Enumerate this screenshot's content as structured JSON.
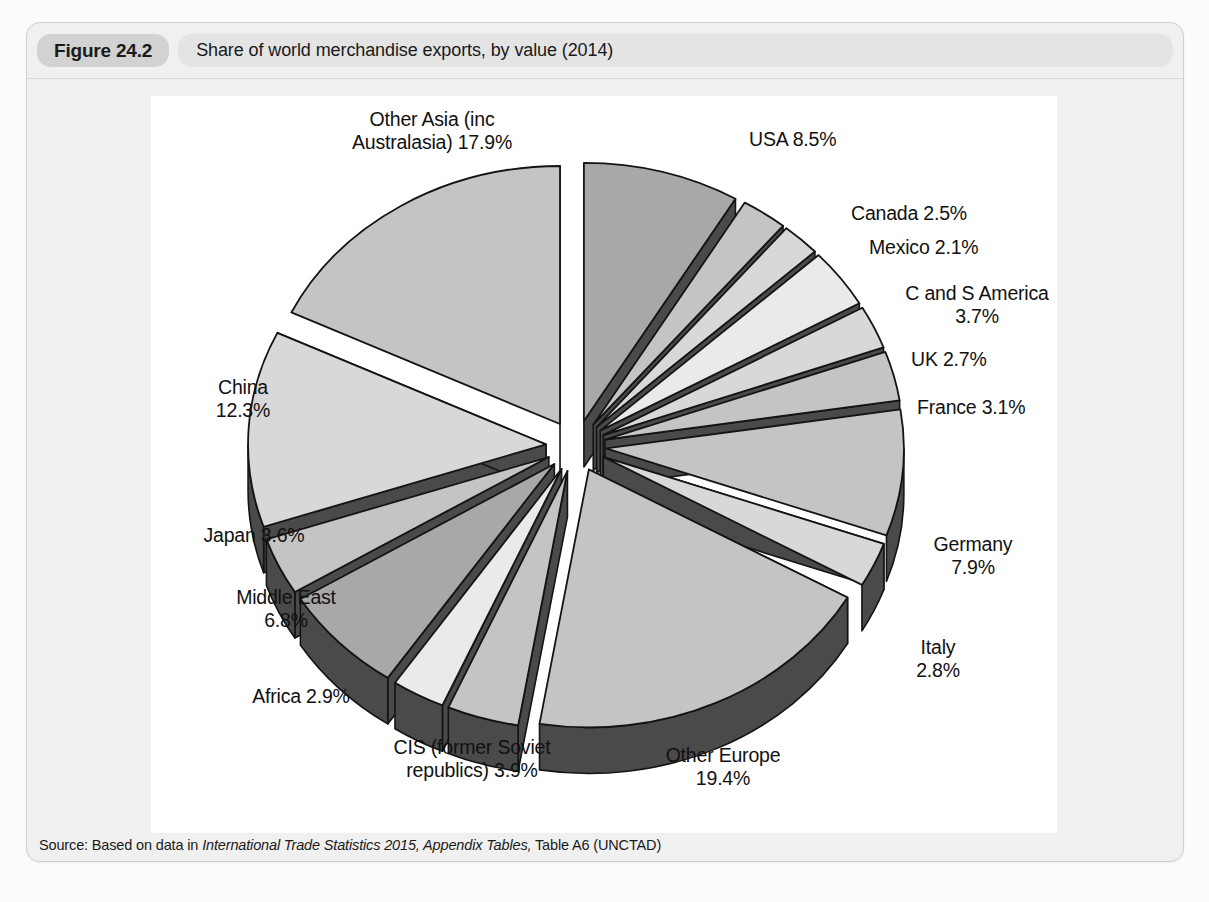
{
  "figure": {
    "badge": "Figure 24.2",
    "title": "Share of world merchandise exports, by value (2014)",
    "source_prefix": "Source: Based on data in ",
    "source_italic": "International Trade Statistics 2015, Appendix Tables,",
    "source_suffix": " Table A6 (UNCTAD)"
  },
  "colors": {
    "panel_bg": "#f0f0f0",
    "badge_bg": "#d2d2d2",
    "title_bg": "#e4e4e4",
    "canvas_bg": "#ffffff",
    "slice_outline": "#141414",
    "side_dark": "#4a4a4a",
    "tone_mid": "#a8a8a8",
    "tone_light": "#c4c4c4",
    "tone_lighter": "#d8d8d8",
    "tone_pale": "#eaeaea"
  },
  "chart_data": {
    "type": "pie",
    "title": "Share of world merchandise exports, by value (2014)",
    "xlabel": "",
    "ylabel": "",
    "exploded": true,
    "three_d": true,
    "units": "percent",
    "legend_position": "none",
    "labels_outside": true,
    "categories": [
      "USA",
      "Canada",
      "Mexico",
      "C and S America",
      "UK",
      "France",
      "Germany",
      "Italy",
      "Other Europe",
      "CIS (former Soviet republics)",
      "Africa",
      "Middle East",
      "Japan",
      "China",
      "Other Asia (inc Australasia)"
    ],
    "values": [
      8.5,
      2.5,
      2.1,
      3.7,
      2.7,
      3.1,
      7.9,
      2.8,
      19.4,
      3.9,
      2.9,
      6.8,
      3.6,
      12.3,
      17.9
    ],
    "slices": [
      {
        "name": "USA",
        "value": 8.5,
        "label": "USA 8.5%",
        "tone": "mid"
      },
      {
        "name": "Canada",
        "value": 2.5,
        "label": "Canada 2.5%",
        "tone": "light"
      },
      {
        "name": "Mexico",
        "value": 2.1,
        "label": "Mexico 2.1%",
        "tone": "lighter"
      },
      {
        "name": "C and S America",
        "value": 3.7,
        "label": "C and S America\n3.7%",
        "tone": "pale"
      },
      {
        "name": "UK",
        "value": 2.7,
        "label": "UK 2.7%",
        "tone": "lighter"
      },
      {
        "name": "France",
        "value": 3.1,
        "label": "France 3.1%",
        "tone": "light"
      },
      {
        "name": "Germany",
        "value": 7.9,
        "label": "Germany\n7.9%",
        "tone": "light"
      },
      {
        "name": "Italy",
        "value": 2.8,
        "label": "Italy\n2.8%",
        "tone": "lighter"
      },
      {
        "name": "Other Europe",
        "value": 19.4,
        "label": "Other Europe\n19.4%",
        "tone": "light"
      },
      {
        "name": "CIS (former Soviet republics)",
        "value": 3.9,
        "label": "CIS (former Soviet\nrepublics) 3.9%",
        "tone": "light"
      },
      {
        "name": "Africa",
        "value": 2.9,
        "label": "Africa 2.9%",
        "tone": "pale"
      },
      {
        "name": "Middle East",
        "value": 6.8,
        "label": "Middle East\n6.8%",
        "tone": "mid"
      },
      {
        "name": "Japan",
        "value": 3.6,
        "label": "Japan 3.6%",
        "tone": "light"
      },
      {
        "name": "China",
        "value": 12.3,
        "label": "China\n12.3%",
        "tone": "lighter"
      },
      {
        "name": "Other Asia (inc Australasia)",
        "value": 17.9,
        "label": "Other Asia (inc\nAustralasia) 17.9%",
        "tone": "light"
      }
    ]
  },
  "labels": [
    {
      "key": "other-asia",
      "text": "Other Asia (inc\nAustralasia) 17.9%",
      "x": 156,
      "y": 12,
      "w": 250,
      "align": "center"
    },
    {
      "key": "usa",
      "text": "USA 8.5%",
      "x": 598,
      "y": 32,
      "w": 180,
      "align": "left"
    },
    {
      "key": "canada",
      "text": "Canada 2.5%",
      "x": 700,
      "y": 106,
      "w": 190,
      "align": "left"
    },
    {
      "key": "mexico",
      "text": "Mexico 2.1%",
      "x": 718,
      "y": 140,
      "w": 190,
      "align": "left"
    },
    {
      "key": "c-and-s",
      "text": "C and S America\n3.7%",
      "x": 726,
      "y": 186,
      "w": 200,
      "align": "center"
    },
    {
      "key": "uk",
      "text": "UK 2.7%",
      "x": 760,
      "y": 252,
      "w": 150,
      "align": "left"
    },
    {
      "key": "france",
      "text": "France 3.1%",
      "x": 766,
      "y": 300,
      "w": 170,
      "align": "left"
    },
    {
      "key": "germany",
      "text": "Germany\n7.9%",
      "x": 742,
      "y": 437,
      "w": 160,
      "align": "center"
    },
    {
      "key": "italy",
      "text": "Italy\n2.8%",
      "x": 722,
      "y": 540,
      "w": 130,
      "align": "center"
    },
    {
      "key": "other-europe",
      "text": "Other Europe\n19.4%",
      "x": 462,
      "y": 648,
      "w": 220,
      "align": "center"
    },
    {
      "key": "cis",
      "text": "CIS (former Soviet\nrepublics) 3.9%",
      "x": 196,
      "y": 640,
      "w": 250,
      "align": "center"
    },
    {
      "key": "africa",
      "text": "Africa 2.9%",
      "x": 60,
      "y": 589,
      "w": 180,
      "align": "center"
    },
    {
      "key": "middle-east",
      "text": "Middle East\n6.8%",
      "x": 40,
      "y": 490,
      "w": 190,
      "align": "center"
    },
    {
      "key": "japan",
      "text": "Japan 3.6%",
      "x": 8,
      "y": 428,
      "w": 190,
      "align": "center"
    },
    {
      "key": "china",
      "text": "China\n12.3%",
      "x": 12,
      "y": 280,
      "w": 160,
      "align": "center"
    }
  ]
}
